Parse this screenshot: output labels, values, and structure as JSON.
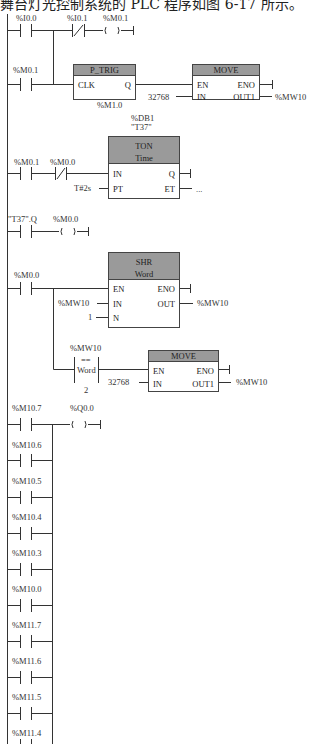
{
  "header": {
    "text": "舞台灯光控制系统的 PLC 程序如图 6-17 所示。"
  },
  "rung1": {
    "contact1": "%I0.0",
    "contact2": "%I0.1",
    "coil": "%M0.1"
  },
  "rung2": {
    "contact": "%M0.1",
    "ptrig": {
      "title": "P_TRIG",
      "clk": "CLK",
      "q": "Q",
      "bit": "%M1.0"
    },
    "move": {
      "title": "MOVE",
      "en": "EN",
      "eno": "ENO",
      "in": "IN",
      "out": "OUT1",
      "in_value": "32768",
      "out_value": "%MW10"
    }
  },
  "rung3": {
    "contact1": "%M0.1",
    "contact2": "%M0.0",
    "ton": {
      "db": "%DB1",
      "name": "\"T37\"",
      "title1": "TON",
      "title2": "Time",
      "in": "IN",
      "q": "Q",
      "pt": "PT",
      "et": "ET",
      "pt_value": "T#2s",
      "et_value": "..."
    }
  },
  "rung4": {
    "contact": "\"T37\".Q",
    "coil": "%M0.0"
  },
  "rung5": {
    "contact": "%M0.0",
    "shr": {
      "title1": "SHR",
      "title2": "Word",
      "en": "EN",
      "eno": "ENO",
      "in": "IN",
      "out": "OUT",
      "n": "N",
      "in_value": "%MW10",
      "out_value": "%MW10",
      "n_value": "1"
    },
    "compare": {
      "operand1": "%MW10",
      "op": "==",
      "type": "Word",
      "operand2": "2"
    },
    "move": {
      "title": "MOVE",
      "en": "EN",
      "eno": "ENO",
      "in": "IN",
      "out": "OUT1",
      "in_value": "32768",
      "out_value": "%MW10"
    }
  },
  "rung6": {
    "coil": "%Q0.0",
    "contacts": [
      "%M10.7",
      "%M10.6",
      "%M10.5",
      "%M10.4",
      "%M10.3",
      "%M10.0",
      "%M11.7",
      "%M11.6",
      "%M11.5",
      "%M11.4"
    ]
  },
  "colors": {
    "block_header": "#9a9a9a",
    "line": "#333333"
  }
}
